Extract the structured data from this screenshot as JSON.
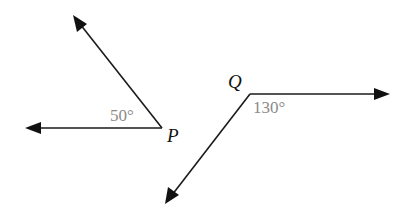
{
  "diagram": {
    "type": "angles",
    "angles": [
      {
        "vertex_label": "P",
        "measure_label": "50°",
        "vertex": [
          162,
          128
        ],
        "rays": [
          {
            "direction": "left",
            "tip": [
              25,
              128
            ]
          },
          {
            "direction": "up-left",
            "tip": [
              73,
              15
            ]
          }
        ]
      },
      {
        "vertex_label": "Q",
        "measure_label": "130°",
        "vertex": [
          250,
          94
        ],
        "rays": [
          {
            "direction": "right",
            "tip": [
              390,
              94
            ]
          },
          {
            "direction": "down-left",
            "tip": [
              165,
              204
            ]
          }
        ]
      }
    ],
    "colors": {
      "ray": "#1a1a1a",
      "angle_label": "#8a8a8a",
      "point_label": "#111111"
    }
  }
}
